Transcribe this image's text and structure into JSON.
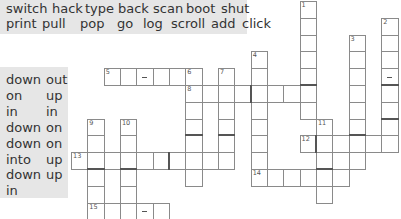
{
  "word_bank_verbs": {
    "row1": [
      "switch",
      "hack",
      "type",
      "back",
      "scan",
      "boot",
      "shut"
    ],
    "row2": [
      "print",
      "pull",
      "pop",
      "go",
      "log",
      "scroll",
      "add",
      "click"
    ]
  },
  "word_bank_particles": [
    [
      "down",
      "out"
    ],
    [
      "on",
      "up"
    ],
    [
      "in",
      "in"
    ],
    [
      "down",
      "on"
    ],
    [
      "down",
      "on"
    ],
    [
      "into",
      "up"
    ],
    [
      "down",
      "up"
    ],
    [
      "in",
      ""
    ]
  ],
  "crossword": {
    "clue_numbers": [
      "1",
      "2",
      "3",
      "4",
      "5",
      "6",
      "7",
      "8",
      "9",
      "10",
      "11",
      "12",
      "13",
      "14",
      "15"
    ],
    "entries": [
      {
        "number": "1",
        "direction": "down",
        "length": 7
      },
      {
        "number": "2",
        "direction": "down",
        "length": 8
      },
      {
        "number": "3",
        "direction": "down",
        "length": 8
      },
      {
        "number": "4",
        "direction": "down",
        "length": 8
      },
      {
        "number": "5",
        "direction": "across",
        "length": 6
      },
      {
        "number": "6",
        "direction": "down",
        "length": 7
      },
      {
        "number": "7",
        "direction": "down",
        "length": 6
      },
      {
        "number": "8",
        "direction": "across",
        "length": 8
      },
      {
        "number": "9",
        "direction": "down",
        "length": 6
      },
      {
        "number": "10",
        "direction": "down",
        "length": 6
      },
      {
        "number": "11",
        "direction": "down",
        "length": 5
      },
      {
        "number": "12",
        "direction": "across",
        "length": 6
      },
      {
        "number": "13",
        "direction": "across",
        "length": 10
      },
      {
        "number": "14",
        "direction": "across",
        "length": 6
      },
      {
        "number": "15",
        "direction": "across",
        "length": 5
      }
    ]
  }
}
